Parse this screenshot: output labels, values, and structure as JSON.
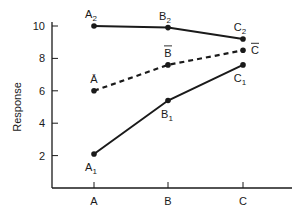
{
  "chart_data": {
    "type": "line",
    "title": "",
    "xlabel": "",
    "ylabel": "Response",
    "categories": [
      "A",
      "B",
      "C"
    ],
    "ylim": [
      0,
      10.5
    ],
    "yticks": [
      2,
      4,
      6,
      8,
      10
    ],
    "grid": false,
    "legend": "none (inline point labels)",
    "series": [
      {
        "name": "2",
        "style": "solid",
        "values": [
          10.0,
          9.9,
          9.2
        ],
        "point_labels": [
          "A2",
          "B2",
          "C2"
        ]
      },
      {
        "name": "mean",
        "style": "dashed",
        "values": [
          6.0,
          7.6,
          8.5
        ],
        "point_labels": [
          "Ā",
          "B̄",
          "C̄"
        ]
      },
      {
        "name": "1",
        "style": "solid",
        "values": [
          2.1,
          5.4,
          7.6
        ],
        "point_labels": [
          "A1",
          "B1",
          "C1"
        ]
      }
    ]
  },
  "colors": {
    "line": "#1a1a1a",
    "background": "#ffffff"
  }
}
